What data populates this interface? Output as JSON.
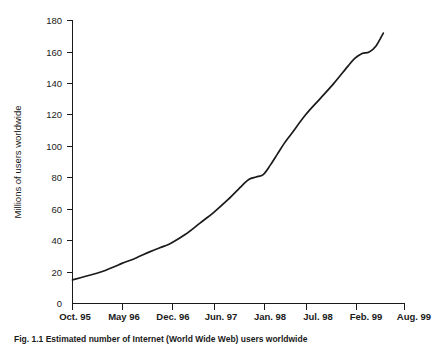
{
  "figure": {
    "caption": "Fig. 1.1 Estimated number of Internet (World Wide Web) users worldwide",
    "background_color": "#ffffff",
    "line_color": "#1a1a1a"
  },
  "chart_data": {
    "type": "line",
    "title": "",
    "subtitle": "",
    "xlabel": "",
    "ylabel": "Millions of users worldwide",
    "xlim": [
      0,
      47
    ],
    "ylim": [
      0,
      180
    ],
    "ytick_step": 20,
    "grid": false,
    "legend": false,
    "legend_position": "none",
    "yticks": [
      0,
      20,
      40,
      60,
      80,
      100,
      120,
      140,
      160,
      180
    ],
    "ytick_labels": [
      "0",
      "20",
      "40",
      "60",
      "80",
      "100",
      "120",
      "140",
      "160",
      "180"
    ],
    "categories": [
      "Oct. 95",
      "May 96",
      "Dec. 96",
      "Jun. 97",
      "Jan. 98",
      "Jul. 98",
      "Feb. 99",
      "Aug. 99"
    ],
    "xtick_labels": [
      "Oct. 95",
      "May 96",
      "Dec. 96",
      "Jun. 97",
      "Jan. 98",
      "Jul. 98",
      "Feb. 99",
      "Aug. 99"
    ],
    "xtick_months": [
      0,
      7,
      14,
      20,
      27,
      33,
      40,
      46
    ],
    "series": [
      {
        "name": "Internet users worldwide",
        "color": "#1a1a1a",
        "x": [
          0,
          2,
          4,
          6,
          7,
          9,
          11,
          13,
          14,
          16,
          18,
          20,
          22,
          24,
          25,
          26,
          27,
          28,
          29,
          30,
          31,
          33,
          35,
          37,
          39,
          40,
          41,
          42,
          43,
          44
        ],
        "values": [
          15,
          17.5,
          20,
          23.5,
          25.5,
          29,
          33,
          36.5,
          38.5,
          44,
          51,
          58,
          66,
          75,
          79,
          80.5,
          82,
          88,
          95,
          102,
          108,
          120,
          130,
          140,
          151,
          156,
          159,
          160,
          164,
          172
        ]
      }
    ],
    "annotations": []
  }
}
